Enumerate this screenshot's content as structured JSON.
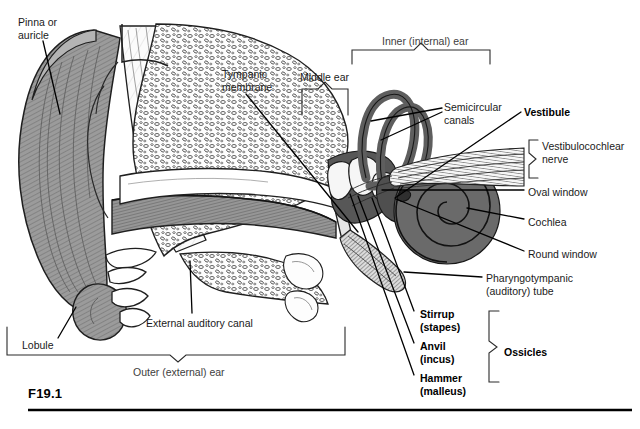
{
  "figure": {
    "id_label": "F19.1",
    "background": "#ffffff"
  },
  "palette": {
    "ink": "#000000",
    "label_text": "#1a1a1a",
    "grey_label_text": "#3d3d3d",
    "pinna_fill": "#9b9b9b",
    "pinna_shade": "#7d7d7d",
    "canal_fill": "#8f8f8f",
    "bone_fill": "#fdfdfd",
    "bone_stroke": "#2a2a2a",
    "cochlea_fill": "#6a6a6a",
    "canals_fill": "#5e5e5e",
    "vestibule_fill": "#4f4f4f",
    "nerve_fill": "#e8e8e8",
    "ossicle_fill": "#f2f2f2",
    "tube_fill": "#d7d7d7",
    "rule": "#000000"
  },
  "labels": [
    {
      "name": "pinna-or-auricle",
      "lines": [
        "Pinna or",
        "auricle"
      ],
      "bold": false,
      "grey": false,
      "x": 18,
      "y": 16
    },
    {
      "name": "tympanic-membrane",
      "lines": [
        "Tympanic",
        "membrane"
      ],
      "bold": false,
      "grey": false,
      "x": 222,
      "y": 68
    },
    {
      "name": "middle-ear",
      "lines": [
        "Middle ear"
      ],
      "bold": false,
      "grey": false,
      "x": 300,
      "y": 71
    },
    {
      "name": "inner-internal-ear",
      "lines": [
        "Inner (internal) ear"
      ],
      "bold": false,
      "grey": true,
      "x": 382,
      "y": 35
    },
    {
      "name": "semicircular-canals",
      "lines": [
        "Semicircular",
        "canals"
      ],
      "bold": false,
      "grey": false,
      "x": 444,
      "y": 101
    },
    {
      "name": "vestibule",
      "lines": [
        "Vestibule"
      ],
      "bold": true,
      "grey": false,
      "x": 524,
      "y": 106
    },
    {
      "name": "vestibulocochlear-nerve",
      "lines": [
        "Vestibulocochlear",
        "nerve"
      ],
      "bold": false,
      "grey": false,
      "x": 542,
      "y": 140
    },
    {
      "name": "oval-window",
      "lines": [
        "Oval window"
      ],
      "bold": false,
      "grey": false,
      "x": 528,
      "y": 186
    },
    {
      "name": "cochlea",
      "lines": [
        "Cochlea"
      ],
      "bold": false,
      "grey": false,
      "x": 528,
      "y": 216
    },
    {
      "name": "round-window",
      "lines": [
        "Round window"
      ],
      "bold": false,
      "grey": false,
      "x": 528,
      "y": 248
    },
    {
      "name": "pharyngotympanic-auditory-tube",
      "lines": [
        "Pharyngotympanic",
        "(auditory) tube"
      ],
      "bold": false,
      "grey": false,
      "x": 486,
      "y": 272
    },
    {
      "name": "stirrup-stapes",
      "lines": [
        "Stirrup",
        "(stapes)"
      ],
      "bold": true,
      "grey": false,
      "x": 420,
      "y": 308
    },
    {
      "name": "anvil-incus",
      "lines": [
        "Anvil",
        "(incus)"
      ],
      "bold": true,
      "grey": false,
      "x": 420,
      "y": 340
    },
    {
      "name": "hammer-malleus",
      "lines": [
        "Hammer",
        "(malleus)"
      ],
      "bold": true,
      "grey": false,
      "x": 420,
      "y": 372
    },
    {
      "name": "ossicles",
      "lines": [
        "Ossicles"
      ],
      "bold": true,
      "grey": false,
      "x": 504,
      "y": 346
    },
    {
      "name": "external-auditory-canal",
      "lines": [
        "External auditory canal"
      ],
      "bold": false,
      "grey": false,
      "x": 146,
      "y": 317
    },
    {
      "name": "lobule",
      "lines": [
        "Lobule"
      ],
      "bold": false,
      "grey": false,
      "x": 22,
      "y": 339
    },
    {
      "name": "outer-external-ear",
      "lines": [
        "Outer (external) ear"
      ],
      "bold": false,
      "grey": true,
      "x": 133,
      "y": 366
    }
  ],
  "brackets": [
    {
      "name": "bracket-inner-ear",
      "orientation": "top",
      "x1": 352,
      "x2": 490,
      "y": 50,
      "tip_x": 421,
      "tip_y": 43,
      "arm": 14
    },
    {
      "name": "bracket-middle-ear",
      "orientation": "top",
      "x1": 302,
      "x2": 348,
      "y": 89,
      "tip_x": 325,
      "tip_y": 82,
      "arm": 26
    },
    {
      "name": "bracket-outer-ear",
      "orientation": "bottom",
      "x1": 7,
      "x2": 345,
      "y": 355,
      "tip_x": 178,
      "tip_y": 362,
      "arm": 28
    },
    {
      "name": "bracket-vestibulocochlear-nerve",
      "orientation": "right",
      "y1": 140,
      "y2": 178,
      "x": 529,
      "tip_x": 536,
      "tip_y": 159,
      "arm": 9
    },
    {
      "name": "bracket-ossicles",
      "orientation": "right",
      "y1": 311,
      "y2": 382,
      "x": 489,
      "tip_x": 497,
      "tip_y": 347,
      "arm": 10
    }
  ],
  "leader_lines": [
    {
      "name": "leader-pinna",
      "points": "43,41 60,114"
    },
    {
      "name": "leader-tympanic-membrane",
      "points": "246,94 358,232"
    },
    {
      "name": "leader-semicircular-canals-a",
      "points": "442,108 371,121"
    },
    {
      "name": "leader-semicircular-canals-b",
      "points": "442,112 381,140"
    },
    {
      "name": "leader-vestibule",
      "points": "521,112 395,198"
    },
    {
      "name": "leader-oval-window",
      "points": "524,190 382,190"
    },
    {
      "name": "leader-cochlea",
      "points": "524,219 467,208"
    },
    {
      "name": "leader-round-window",
      "points": "524,251 396,199"
    },
    {
      "name": "leader-pharyngotympanic",
      "points": "482,277 404,272"
    },
    {
      "name": "leader-stirrup",
      "points": "414,311 372,198"
    },
    {
      "name": "leader-anvil",
      "points": "414,343 358,196"
    },
    {
      "name": "leader-hammer",
      "points": "414,375 350,194"
    },
    {
      "name": "leader-external-auditory-canal",
      "points": "192,313 190,261"
    },
    {
      "name": "leader-lobule",
      "points": "58,338 76,307"
    }
  ],
  "rule": {
    "name": "figure-bottom-rule",
    "x1": 28,
    "x2": 632,
    "y": 410
  }
}
